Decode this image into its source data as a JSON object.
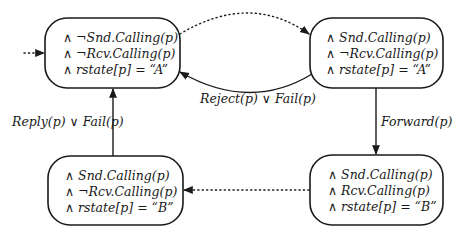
{
  "diagram": {
    "type": "state-transition",
    "colors": {
      "stroke": "#1a1a1a",
      "background": "#ffffff"
    },
    "states": [
      {
        "id": "top-left",
        "lines": [
          "∧ ¬Snd.Calling(p)",
          "∧ ¬Rcv.Calling(p)",
          "∧ rstate[p] = “A”"
        ]
      },
      {
        "id": "top-right",
        "lines": [
          "∧ Snd.Calling(p)",
          "∧ ¬Rcv.Calling(p)",
          "∧ rstate[p] = “A”"
        ]
      },
      {
        "id": "bottom-right",
        "lines": [
          "∧ Snd.Calling(p)",
          "∧ Rcv.Calling(p)",
          "∧ rstate[p] = “B”"
        ]
      },
      {
        "id": "bottom-left",
        "lines": [
          "∧ Snd.Calling(p)",
          "∧ ¬Rcv.Calling(p)",
          "∧ rstate[p] = “B”"
        ]
      }
    ],
    "transitions": [
      {
        "from": "initial",
        "to": "top-left",
        "style": "dotted",
        "label": ""
      },
      {
        "from": "top-left",
        "to": "top-right",
        "style": "dotted",
        "label": ""
      },
      {
        "from": "top-right",
        "to": "top-left",
        "style": "solid",
        "label": "Reject(p) ∨ Fail(p)"
      },
      {
        "from": "top-right",
        "to": "bottom-right",
        "style": "solid",
        "label": "Forward(p)"
      },
      {
        "from": "bottom-right",
        "to": "bottom-left",
        "style": "dotted",
        "label": ""
      },
      {
        "from": "bottom-left",
        "to": "top-left",
        "style": "solid",
        "label": "Reply(p) ∨ Fail(p)"
      }
    ]
  }
}
